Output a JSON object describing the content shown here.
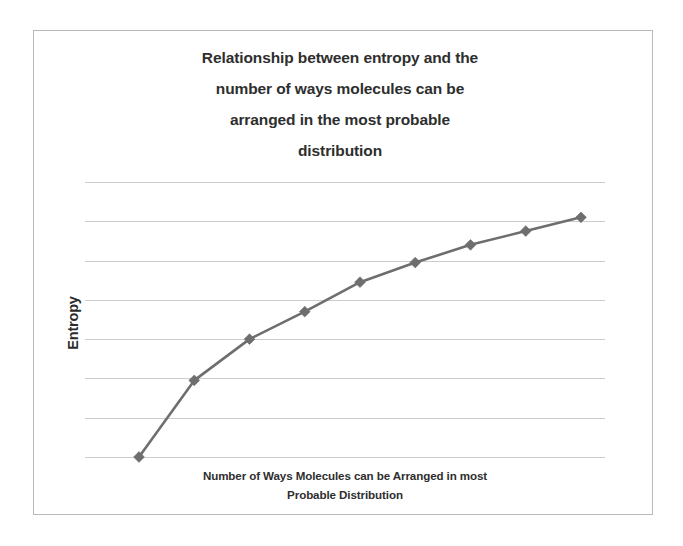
{
  "figure": {
    "background_color": "#ffffff",
    "border_color": "#b9b9b9",
    "title_lines": [
      "Relationship between entropy and the",
      "number of ways molecules can be",
      "arranged in the most probable",
      "distribution"
    ],
    "title_text": "Relationship between entropy and the number of ways molecules can be arranged in the most probable distribution",
    "y_axis_title": "Entropy",
    "x_axis_title_lines": [
      "Number of Ways Molecules can be Arranged in most",
      "Probable Distribution"
    ],
    "x_axis_title_text": "Number of Ways Molecules can be Arranged in most Probable Distribution"
  },
  "chart_data": {
    "type": "line",
    "title": "Relationship between entropy and the number of ways molecules can be arranged in the most probable distribution",
    "xlabel": "Number of Ways Molecules can be Arranged in most Probable Distribution",
    "ylabel": "Entropy",
    "x": [
      1,
      2,
      3,
      4,
      5,
      6,
      7,
      8,
      9
    ],
    "values": [
      0.0,
      1.95,
      3.0,
      3.7,
      4.45,
      4.95,
      5.4,
      5.75,
      6.1
    ],
    "series": [
      {
        "name": "Entropy",
        "values": [
          0.0,
          1.95,
          3.0,
          3.7,
          4.45,
          4.95,
          5.4,
          5.75,
          6.1
        ],
        "color": "#6e6e6e",
        "marker": "diamond",
        "line_width": 2.6
      }
    ],
    "xlim": [
      0,
      10
    ],
    "ylim": [
      0,
      7
    ],
    "grid": true,
    "grid_axis": "y",
    "grid_color": "#c3c3c3",
    "gridline_count": 8,
    "y_tick_labels_shown": false,
    "x_tick_labels_shown": false,
    "legend": false,
    "legend_position": "none"
  }
}
